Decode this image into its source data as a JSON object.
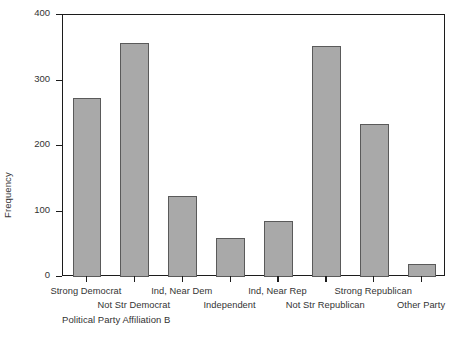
{
  "chart_data": {
    "type": "bar",
    "title": "",
    "xlabel": "Political Party Affiliation B",
    "ylabel": "Frequency",
    "categories": [
      "Strong Democrat",
      "Not Str Democrat",
      "Ind, Near Dem",
      "Independent",
      "Ind, Near Rep",
      "Not Str Republican",
      "Strong Republican",
      "Other Party"
    ],
    "values": [
      274,
      357,
      124,
      59,
      86,
      353,
      234,
      20
    ],
    "ylim": [
      0,
      400
    ],
    "yticks": [
      0,
      100,
      200,
      300,
      400
    ],
    "ytick_labels": [
      "0",
      "100",
      "200",
      "300",
      "400"
    ],
    "grid": false,
    "legend": "none",
    "bar_fill": "#a9a9a9",
    "bar_edge": "#5a5a5a",
    "axis_color": "#1c1c1c",
    "background": "#ffffff"
  },
  "axis": {
    "y_label": "Frequency",
    "x_label": "Political Party Affiliation B"
  }
}
